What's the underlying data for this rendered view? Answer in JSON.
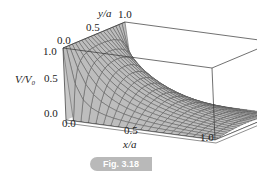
{
  "figure": {
    "caption": "Fig. 3.18",
    "axes": {
      "x_label": "x/a",
      "y_label": "y/a",
      "z_label": "V/V₀",
      "x_ticks": [
        "0.0",
        "0.5",
        "1.0"
      ],
      "y_ticks": [
        "0.0",
        "0.5",
        "1.0"
      ],
      "z_ticks": [
        "0.0",
        "0.5",
        "1.0"
      ]
    },
    "surface": {
      "description": "3D surface plot of potential V/V0 over the square 0<=x/a<=1, 0<=y/a<=1; V=V0 along x=0 face, decaying exponentially to 0 as x increases",
      "fill_color": "#bdbdbd",
      "mesh_color": "#555555",
      "box_color": "#333333"
    }
  },
  "chart_data": {
    "type": "surface",
    "title": "",
    "xlabel": "x/a",
    "ylabel": "y/a",
    "zlabel": "V/V0",
    "x_range": [
      0,
      1
    ],
    "y_range": [
      0,
      1
    ],
    "z_range": [
      0,
      1
    ],
    "x_ticks": [
      0.0,
      0.5,
      1.0
    ],
    "y_ticks": [
      0.0,
      0.5,
      1.0
    ],
    "z_ticks": [
      0.0,
      0.5,
      1.0
    ],
    "caption": "Fig. 3.18"
  }
}
